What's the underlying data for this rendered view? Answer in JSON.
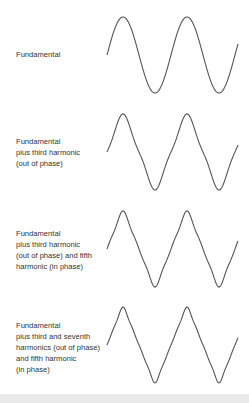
{
  "figure": {
    "panels": [
      {
        "label_lines": [
          "Fundamental"
        ],
        "harmonics": [
          {
            "n": 1,
            "amp": 1.0
          }
        ],
        "label_top": 49,
        "mid_y": 55
      },
      {
        "label_lines": [
          "Fundamental",
          "plus third harmonic",
          "(out of phase)"
        ],
        "harmonics": [
          {
            "n": 1,
            "amp": 1.0
          },
          {
            "n": 3,
            "amp": -0.111
          }
        ],
        "label_top": 136,
        "mid_y": 152
      },
      {
        "label_lines": [
          "Fundamental",
          "plus third harmonic",
          "(out of phase) and fifth",
          "harmonic (in phase)"
        ],
        "harmonics": [
          {
            "n": 1,
            "amp": 1.0
          },
          {
            "n": 3,
            "amp": -0.111
          },
          {
            "n": 5,
            "amp": 0.04
          }
        ],
        "label_top": 228,
        "mid_y": 249
      },
      {
        "label_lines": [
          "Fundamental",
          "plus third and seventh",
          "harmonics (out of phase)",
          "and fifth harmonic",
          "(in phase)"
        ],
        "harmonics": [
          {
            "n": 1,
            "amp": 1.0
          },
          {
            "n": 3,
            "amp": -0.111
          },
          {
            "n": 5,
            "amp": 0.04
          },
          {
            "n": 7,
            "amp": -0.0204
          }
        ],
        "label_top": 320,
        "mid_y": 345
      }
    ],
    "wave_x_start": 107,
    "wave_x_end": 238,
    "period_px": 64,
    "amplitude_px": 38,
    "stroke_color": "#555555"
  },
  "chart_data": {
    "type": "line",
    "title": "",
    "series": [
      {
        "name": "Fundamental",
        "harmonics": [
          1
        ],
        "shape": "sine"
      },
      {
        "name": "Fundamental plus third harmonic (out of phase)",
        "harmonics": [
          1,
          3
        ],
        "shape": "slightly peaked sine"
      },
      {
        "name": "Fundamental plus third harmonic (out of phase) and fifth harmonic (in phase)",
        "harmonics": [
          1,
          3,
          5
        ],
        "shape": "near-triangle"
      },
      {
        "name": "Fundamental plus third and seventh harmonics (out of phase) and fifth harmonic (in phase)",
        "harmonics": [
          1,
          3,
          5,
          7
        ],
        "shape": "triangle"
      }
    ],
    "cycles_shown": 2,
    "xlabel": "",
    "ylabel": "",
    "grid": false
  }
}
